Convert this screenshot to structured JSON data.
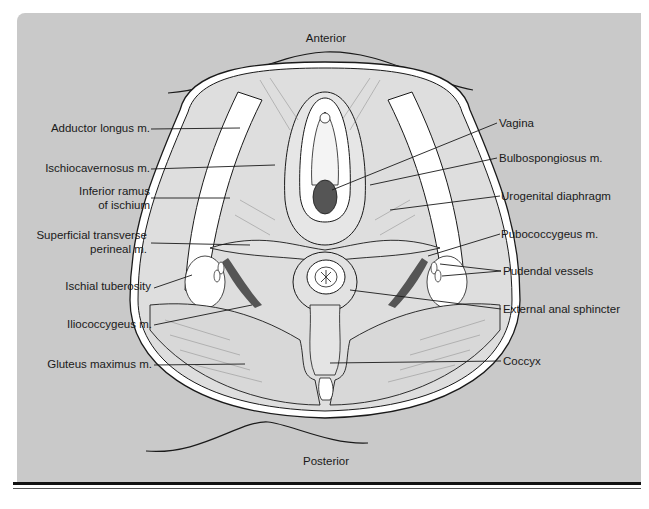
{
  "figure": {
    "orientation": {
      "top": "Anterior",
      "bottom": "Posterior"
    },
    "left_labels": [
      {
        "text": "Adductor longus m."
      },
      {
        "text": "Ischiocavernosus m."
      },
      {
        "text_line1": "Inferior ramus",
        "text_line2": "of ischium"
      },
      {
        "text_line1": "Superficial transverse",
        "text_line2": "perineal m."
      },
      {
        "text": "Ischial tuberosity"
      },
      {
        "text": "Iliococcygeus m."
      },
      {
        "text": "Gluteus maximus m."
      }
    ],
    "right_labels": [
      {
        "text": "Vagina"
      },
      {
        "text": "Bulbospongiosus m."
      },
      {
        "text": "Urogenital diaphragm"
      },
      {
        "text": "Pubococcygeus m."
      },
      {
        "text": "Pudendal vessels"
      },
      {
        "text": "External anal sphincter"
      },
      {
        "text": "Coccyx"
      }
    ],
    "colors": {
      "background_panel": "#c9c9c9",
      "muscle_fill": "#dedede",
      "bone_fill": "#ffffff",
      "outline": "#1a1a1a",
      "dark_fill": "#555555"
    }
  }
}
